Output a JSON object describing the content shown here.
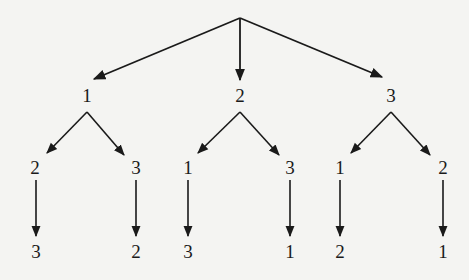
{
  "diagram": {
    "type": "permutation-tree",
    "root": {
      "x": 240,
      "y": 18
    },
    "level1": [
      {
        "label": "1",
        "x": 87,
        "y": 95
      },
      {
        "label": "2",
        "x": 240,
        "y": 95
      },
      {
        "label": "3",
        "x": 391,
        "y": 95
      }
    ],
    "level2": [
      {
        "label": "2",
        "x": 35,
        "y": 167
      },
      {
        "label": "3",
        "x": 136,
        "y": 167
      },
      {
        "label": "1",
        "x": 188,
        "y": 167
      },
      {
        "label": "3",
        "x": 290,
        "y": 167
      },
      {
        "label": "1",
        "x": 340,
        "y": 167
      },
      {
        "label": "2",
        "x": 443,
        "y": 167
      }
    ],
    "level3": [
      {
        "label": "3",
        "x": 36,
        "y": 251
      },
      {
        "label": "2",
        "x": 136,
        "y": 251
      },
      {
        "label": "3",
        "x": 188,
        "y": 251
      },
      {
        "label": "1",
        "x": 290,
        "y": 251
      },
      {
        "label": "2",
        "x": 340,
        "y": 251
      },
      {
        "label": "1",
        "x": 443,
        "y": 251
      }
    ],
    "colors": {
      "background": "#f4f4f2",
      "ink": "#1a1a1a"
    }
  }
}
